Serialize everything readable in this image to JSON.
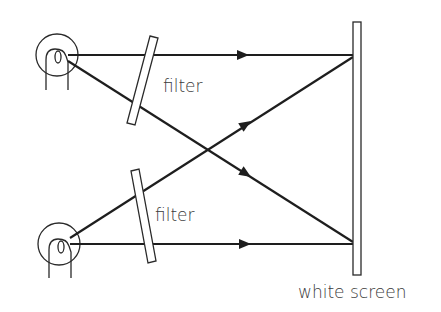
{
  "diagram": {
    "type": "optics-schematic",
    "labels": {
      "filter_top": "filter",
      "filter_bottom": "filter",
      "screen": "white screen"
    },
    "components": [
      {
        "id": "lamp-top",
        "kind": "lamp",
        "center": [
          57,
          55
        ],
        "radius": 21
      },
      {
        "id": "lamp-bottom",
        "kind": "lamp",
        "center": [
          59,
          244
        ],
        "radius": 21
      },
      {
        "id": "filter-top",
        "kind": "filter",
        "from": [
          154,
          37
        ],
        "to": [
          131,
          124
        ]
      },
      {
        "id": "filter-bottom",
        "kind": "filter",
        "from": [
          135,
          170
        ],
        "to": [
          152,
          262
        ]
      },
      {
        "id": "white-screen",
        "kind": "screen",
        "x": 353,
        "y_top": 22,
        "y_bottom": 275
      }
    ],
    "rays": [
      {
        "from": "lamp-top",
        "to": "screen-top",
        "direction": "horizontal"
      },
      {
        "from": "lamp-top",
        "to": "screen-bottom",
        "direction": "diagonal-down"
      },
      {
        "from": "lamp-bottom",
        "to": "screen-top",
        "direction": "diagonal-up"
      },
      {
        "from": "lamp-bottom",
        "to": "screen-bottom",
        "direction": "horizontal"
      }
    ]
  }
}
